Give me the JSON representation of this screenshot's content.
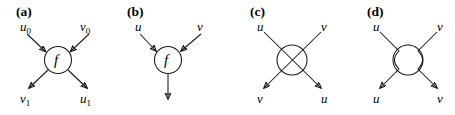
{
  "figure": {
    "background_color": "#ffffff",
    "stroke_color": "#1a1a1a",
    "width": 455,
    "height": 115,
    "panel_count": 4
  },
  "panels": {
    "a": {
      "tag": "(a)",
      "node_label": "f",
      "node_shape": "circle",
      "inputs": [
        {
          "base": "u",
          "subscript": "0"
        },
        {
          "base": "v",
          "subscript": "0"
        }
      ],
      "outputs": [
        {
          "base": "v",
          "subscript": "1"
        },
        {
          "base": "u",
          "subscript": "1"
        }
      ],
      "arrow_count": 4,
      "description": "two inputs into circled f, two outputs"
    },
    "b": {
      "tag": "(b)",
      "node_label": "f",
      "node_shape": "circle",
      "inputs": [
        {
          "base": "u",
          "subscript": ""
        },
        {
          "base": "v",
          "subscript": ""
        }
      ],
      "outputs": [],
      "arrow_count": 3,
      "description": "two inputs into circled f, single vertical output arrow"
    },
    "c": {
      "tag": "(c)",
      "node_label": "",
      "node_shape": "circle-with-crossing",
      "inputs": [
        {
          "base": "u",
          "subscript": ""
        },
        {
          "base": "v",
          "subscript": ""
        }
      ],
      "outputs": [
        {
          "base": "v",
          "subscript": ""
        },
        {
          "base": "u",
          "subscript": ""
        }
      ],
      "arrow_count": 2,
      "description": "swap: lines cross through circle, u and v exchange sides"
    },
    "d": {
      "tag": "(d)",
      "node_label": "",
      "node_shape": "circle-with-bypass",
      "inputs": [
        {
          "base": "u",
          "subscript": ""
        },
        {
          "base": "v",
          "subscript": ""
        }
      ],
      "outputs": [
        {
          "base": "u",
          "subscript": ""
        },
        {
          "base": "v",
          "subscript": ""
        }
      ],
      "arrow_count": 2,
      "description": "identity braid: lines bow around circle, u and v keep sides"
    }
  }
}
